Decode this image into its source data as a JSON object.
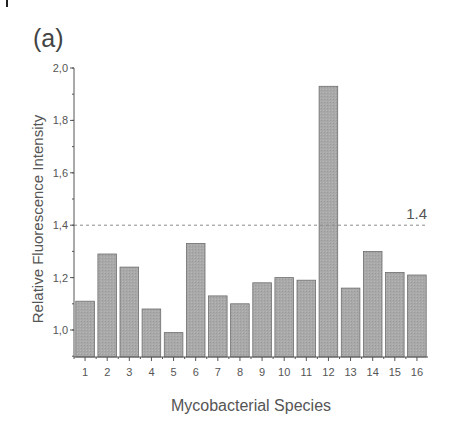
{
  "panel_label": "(a)",
  "chart_data": {
    "type": "bar",
    "title": "",
    "panel": "(a)",
    "xlabel": "Mycobacterial Species",
    "ylabel": "Relative Fluorescence Intensity",
    "categories": [
      "1",
      "2",
      "3",
      "4",
      "5",
      "6",
      "7",
      "8",
      "9",
      "10",
      "11",
      "12",
      "13",
      "14",
      "15",
      "16"
    ],
    "values": [
      1.11,
      1.29,
      1.24,
      1.08,
      0.99,
      1.33,
      1.13,
      1.1,
      1.18,
      1.2,
      1.19,
      1.93,
      1.16,
      1.3,
      1.22,
      1.21
    ],
    "ylim": [
      0.9,
      2.0
    ],
    "yticks": [
      1.0,
      1.2,
      1.4,
      1.6,
      1.8,
      2.0
    ],
    "ytick_labels": [
      "1,0",
      "1,2",
      "1,4",
      "1,6",
      "1,8",
      "2,0"
    ],
    "threshold": {
      "value": 1.4,
      "label": "1.4",
      "style": "dashed"
    },
    "grid": false,
    "legend": null,
    "colors": {
      "bar_fill": "#a8a8a8",
      "bar_stroke": "#6e6e6e",
      "axis": "#555555",
      "threshold": "#8a8a8a"
    }
  }
}
